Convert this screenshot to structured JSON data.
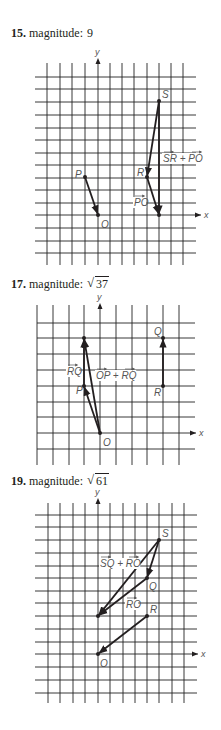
{
  "problems": [
    {
      "number": "15.",
      "word": "magnitude:",
      "value": "9",
      "value_type": "plain",
      "label_top": 26,
      "svg_top": 50,
      "grid": {
        "vx": [
          47,
          60,
          72,
          85,
          98,
          110,
          122,
          134,
          147,
          159,
          171,
          183
        ],
        "hy": [
          77,
          89,
          102,
          115,
          128,
          140,
          153,
          165,
          178,
          190,
          203,
          215,
          228,
          241,
          253
        ],
        "v_top": 63,
        "v_bottom": 265,
        "h_left": 35,
        "h_right": 196
      },
      "axes": {
        "y_x": 98,
        "y_top": 58,
        "y_label": "y",
        "x_y": 215,
        "x_right": 201,
        "x_label": "x"
      },
      "points": [
        {
          "name": "P",
          "x": 85,
          "y": 177,
          "lx": 75,
          "ly": 178
        },
        {
          "name": "O",
          "x": 98,
          "y": 215,
          "lx": 101,
          "ly": 228
        },
        {
          "name": "S",
          "x": 159,
          "y": 101,
          "lx": 162,
          "ly": 98
        },
        {
          "name": "R",
          "x": 147,
          "y": 177,
          "lx": 137,
          "ly": 176
        },
        {
          "name": "",
          "x": 159,
          "y": 215,
          "lx": 0,
          "ly": 0
        }
      ],
      "vectors": [
        {
          "x1": 85,
          "y1": 177,
          "x2": 98,
          "y2": 215
        },
        {
          "x1": 159,
          "y1": 101,
          "x2": 147,
          "y2": 177
        },
        {
          "x1": 147,
          "y1": 177,
          "x2": 159,
          "y2": 215
        },
        {
          "x1": 159,
          "y1": 101,
          "x2": 159,
          "y2": 215
        }
      ],
      "labels": [
        {
          "text": "SR + PO",
          "vec": [
            "SR",
            "PO"
          ],
          "x": 163,
          "y": 162
        },
        {
          "text": "PO",
          "vec": [
            "PO"
          ],
          "x": 134,
          "y": 206
        }
      ]
    },
    {
      "number": "17.",
      "word": "magnitude:",
      "value": "37",
      "value_type": "sqrt",
      "label_top": 277,
      "svg_top": 290,
      "grid": {
        "vx": [
          37,
          53,
          69,
          84,
          100,
          116,
          132,
          147,
          163,
          179
        ],
        "hy": [
          323,
          338,
          354,
          370,
          386,
          402,
          417,
          433,
          449
        ],
        "v_top": 305,
        "v_bottom": 465,
        "h_left": 37,
        "h_right": 195
      },
      "axes": {
        "y_x": 100,
        "y_top": 303,
        "y_label": "y",
        "x_y": 433,
        "x_right": 196,
        "x_label": "x"
      },
      "points": [
        {
          "name": "P",
          "x": 84,
          "y": 386,
          "lx": 76,
          "ly": 394
        },
        {
          "name": "O",
          "x": 100,
          "y": 433,
          "lx": 103,
          "ly": 446
        },
        {
          "name": "Q",
          "x": 163,
          "y": 338,
          "lx": 154,
          "ly": 335
        },
        {
          "name": "R",
          "x": 163,
          "y": 386,
          "lx": 154,
          "ly": 396
        },
        {
          "name": "",
          "x": 84,
          "y": 338,
          "lx": 0,
          "ly": 0
        }
      ],
      "vectors": [
        {
          "x1": 100,
          "y1": 433,
          "x2": 84,
          "y2": 386
        },
        {
          "x1": 84,
          "y1": 386,
          "x2": 84,
          "y2": 338
        },
        {
          "x1": 100,
          "y1": 433,
          "x2": 84,
          "y2": 338
        },
        {
          "x1": 163,
          "y1": 386,
          "x2": 163,
          "y2": 338
        }
      ],
      "labels": [
        {
          "text": "RQ",
          "vec": [
            "RQ"
          ],
          "x": 67,
          "y": 375
        },
        {
          "text": "OP + RQ",
          "vec": [
            "OP",
            "RQ"
          ],
          "x": 96,
          "y": 379
        }
      ]
    },
    {
      "number": "19.",
      "word": "magnitude:",
      "value": "61",
      "value_type": "sqrt",
      "label_top": 474,
      "svg_top": 490,
      "grid": {
        "vx": [
          48,
          60,
          73,
          85,
          98,
          110,
          123,
          135,
          147,
          159,
          172,
          184
        ],
        "hy": [
          515,
          527,
          540,
          553,
          566,
          578,
          591,
          603,
          616,
          629,
          642,
          654,
          667,
          680,
          693
        ],
        "v_top": 503,
        "v_bottom": 703,
        "h_left": 35,
        "h_right": 197
      },
      "axes": {
        "y_x": 98,
        "y_top": 498,
        "y_label": "y",
        "x_y": 654,
        "x_right": 198,
        "x_label": "x"
      },
      "points": [
        {
          "name": "S",
          "x": 159,
          "y": 540,
          "lx": 162,
          "ly": 537
        },
        {
          "name": "Q",
          "x": 147,
          "y": 578,
          "lx": 149,
          "ly": 590
        },
        {
          "name": "R",
          "x": 147,
          "y": 616,
          "lx": 150,
          "ly": 613
        },
        {
          "name": "O",
          "x": 98,
          "y": 654,
          "lx": 100,
          "ly": 667
        },
        {
          "name": "",
          "x": 98,
          "y": 616,
          "lx": 0,
          "ly": 0
        }
      ],
      "vectors": [
        {
          "x1": 159,
          "y1": 540,
          "x2": 147,
          "y2": 578
        },
        {
          "x1": 147,
          "y1": 578,
          "x2": 98,
          "y2": 616
        },
        {
          "x1": 159,
          "y1": 540,
          "x2": 98,
          "y2": 616
        },
        {
          "x1": 147,
          "y1": 616,
          "x2": 98,
          "y2": 654
        }
      ],
      "labels": [
        {
          "text": "SQ + RO",
          "vec": [
            "SQ",
            "RO"
          ],
          "x": 100,
          "y": 567
        },
        {
          "text": "RO",
          "vec": [
            "RO"
          ],
          "x": 126,
          "y": 608
        }
      ]
    }
  ],
  "colors": {
    "ink": "#231f20",
    "grid": "#222222",
    "label": "#555555"
  }
}
